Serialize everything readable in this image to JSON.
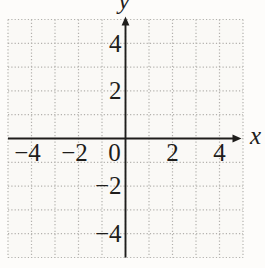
{
  "chart_data": {
    "type": "scatter",
    "title": "",
    "subtitle": "",
    "xlabel": "x",
    "ylabel": "y",
    "xlim": [
      -5,
      5
    ],
    "ylim": [
      -5,
      5
    ],
    "grid": "on",
    "grid_style": "dotted",
    "grid_step": 1,
    "x_ticks": [
      -4,
      -2,
      0,
      2,
      4
    ],
    "x_tick_labels": [
      "−4",
      "−2",
      "0",
      "2",
      "4"
    ],
    "y_ticks": [
      4,
      2,
      -2,
      -4
    ],
    "y_tick_labels": [
      "4",
      "2",
      "−2",
      "−4"
    ],
    "series": [],
    "annotations": [],
    "legend": "none",
    "colors": {
      "background": "#fdfcfa",
      "grid_background": "#faf9f6",
      "gridline": "#b3b1ad",
      "axis": "#1e1d1b",
      "text": "#1e1d1b"
    }
  }
}
